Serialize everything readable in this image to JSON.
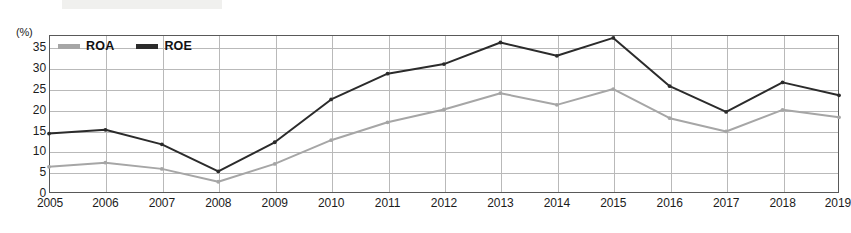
{
  "chart_data": {
    "type": "line",
    "title": "",
    "xlabel": "",
    "ylabel": "(%)",
    "yunit": "(%)",
    "categories": [
      "2005",
      "2006",
      "2007",
      "2008",
      "2009",
      "2010",
      "2011",
      "2012",
      "2013",
      "2014",
      "2015",
      "2016",
      "2017",
      "2018",
      "2019"
    ],
    "ylim": [
      0,
      38
    ],
    "yticks": [
      0,
      5,
      10,
      15,
      20,
      25,
      30,
      35
    ],
    "ytick_labels": [
      "0",
      "5",
      "10",
      "15",
      "20",
      "25",
      "30",
      "35"
    ],
    "grid": true,
    "legend_position": "top-left",
    "series": [
      {
        "name": "ROA",
        "color": "#a6a6a6",
        "values": [
          6.3,
          7.3,
          5.8,
          2.7,
          7.0,
          12.7,
          17.0,
          20.1,
          24.0,
          21.2,
          25.0,
          18.0,
          14.8,
          20.0,
          18.2
        ]
      },
      {
        "name": "ROE",
        "color": "#2b2b2b",
        "values": [
          14.3,
          15.2,
          11.7,
          5.2,
          12.2,
          22.5,
          28.7,
          31.0,
          36.2,
          33.0,
          37.3,
          25.7,
          19.5,
          26.6,
          23.5
        ]
      }
    ]
  },
  "legend": {
    "items": [
      {
        "label": "ROA",
        "color": "#a6a6a6"
      },
      {
        "label": "ROE",
        "color": "#2b2b2b"
      }
    ]
  },
  "colors": {
    "roa": "#a6a6a6",
    "roe": "#2b2b2b",
    "grid": "#b9b9b9",
    "frame": "#595959",
    "text": "#1b1b1b",
    "background": "#ffffff"
  }
}
